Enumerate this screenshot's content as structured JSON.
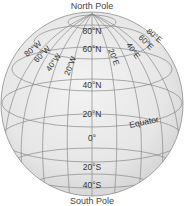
{
  "diagram": {
    "type": "globe-latitude-longitude",
    "poles": {
      "north": "North Pole",
      "south": "South Pole"
    },
    "latitudes": {
      "n80": "80°N",
      "n60": "60°N",
      "n40": "40°N",
      "n20": "20°N",
      "zero": "0°",
      "s20": "20°S",
      "s40": "40°S"
    },
    "longitudes": {
      "w80": "80°W",
      "w60": "60°W",
      "w40": "40°W",
      "w20": "20°W",
      "e20": "20°E",
      "e40": "40°E",
      "e60": "60°E",
      "e80": "80°E"
    },
    "equator_label": "Equator",
    "colors": {
      "sphere_light": "#f2f2f2",
      "sphere_dark": "#d6d6d6",
      "grid": "#8a8a8a",
      "text": "#333333"
    }
  }
}
